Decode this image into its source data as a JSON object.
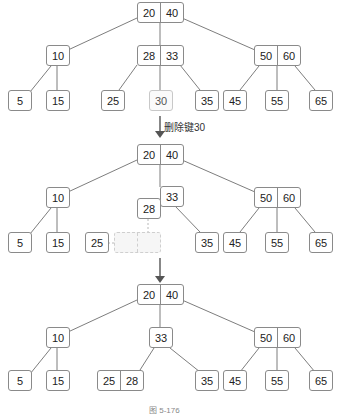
{
  "figure": {
    "type": "b-tree-deletion",
    "caption": "图 5-176"
  },
  "stage1": {
    "root": [
      "20",
      "40"
    ],
    "level2": [
      [
        "10"
      ],
      [
        "28",
        "33"
      ],
      [
        "50",
        "60"
      ]
    ],
    "leaves": [
      "5",
      "15",
      "25",
      "30",
      "35",
      "45",
      "55",
      "65"
    ],
    "highlighted_leaf": "30"
  },
  "step_arrow_1": {
    "label": "删除键30"
  },
  "stage2": {
    "root": [
      "20",
      "40"
    ],
    "level2": [
      [
        "10"
      ],
      [
        "33"
      ],
      [
        "50",
        "60"
      ]
    ],
    "borrowed": "28",
    "leaves": [
      "5",
      "15",
      "25",
      "35",
      "45",
      "55",
      "65"
    ],
    "empty_slots": [
      "",
      ""
    ]
  },
  "stage3": {
    "root": [
      "20",
      "40"
    ],
    "level2": [
      [
        "10"
      ],
      [
        "33"
      ],
      [
        "50",
        "60"
      ]
    ],
    "leaves": [
      [
        "5"
      ],
      [
        "15"
      ],
      [
        "25",
        "28"
      ],
      [
        "35"
      ],
      [
        "45"
      ],
      [
        "55"
      ],
      [
        "65"
      ]
    ]
  },
  "colors": {
    "edge": "#6e6e6e",
    "node_border": "#8a8a8a",
    "faded_border": "#c8c8c8",
    "dashed": "#cfcfcf",
    "arrow": "#555555"
  }
}
